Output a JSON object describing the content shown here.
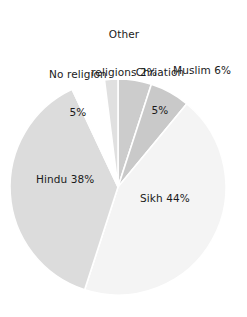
{
  "chart_data": {
    "type": "pie",
    "title": "",
    "subtitle": "",
    "xlabel": "",
    "ylabel": "",
    "legend_position": "none",
    "grid": false,
    "labels_inline": true,
    "start_angle_deg": 0,
    "direction": "clockwise",
    "categories": [
      "Chriation",
      "Muslim",
      "Sikh",
      "Hindu",
      "No religion",
      "Other religions"
    ],
    "values": [
      5,
      6,
      44,
      38,
      5,
      2
    ],
    "units": "%",
    "colors": [
      "#cccccc",
      "#c9c9c9",
      "#f4f4f4",
      "#dcdcdc",
      "#ffffff",
      "#e0e0e0"
    ],
    "separator_color": "#ffffff",
    "slices": [
      {
        "name": "Chriation",
        "value": 5,
        "label": "Chriation\n5%",
        "color": "#cccccc"
      },
      {
        "name": "Muslim",
        "value": 6,
        "label": "Muslim 6%",
        "color": "#c9c9c9"
      },
      {
        "name": "Sikh",
        "value": 44,
        "label": "Sikh 44%",
        "color": "#f4f4f4"
      },
      {
        "name": "Hindu",
        "value": 38,
        "label": "Hindu 38%",
        "color": "#dcdcdc"
      },
      {
        "name": "No religion",
        "value": 5,
        "label": "No religion\n5%",
        "color": "#ffffff"
      },
      {
        "name": "Other religions",
        "value": 2,
        "label": "Other\nreligions 2%",
        "color": "#e0e0e0"
      }
    ]
  },
  "labels": {
    "other_line1": "Other",
    "other_line2": "religions 2%",
    "noreligion_line1": "No religion",
    "noreligion_line2": "5%",
    "christian_line1": "Chriation",
    "christian_line2": "5%",
    "muslim": "Muslim 6%",
    "hindu": "Hindu 38%",
    "sikh": "Sikh 44%"
  }
}
